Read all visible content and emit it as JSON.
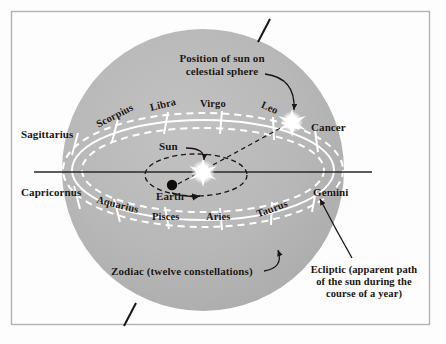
{
  "figure": {
    "border_color": "#b0b0b0",
    "background_color": "#fdfdfd",
    "sphere_color": "#b7b7b7",
    "band_line_color": "#ffffff",
    "ink_color": "#1a1512"
  },
  "annotations": {
    "sun_position": "Position of sun on\ncelestial sphere",
    "sun_position_line1": "Position of sun on",
    "sun_position_line2": "celestial sphere",
    "zodiac": "Zodiac (twelve constellations)",
    "ecliptic_line1": "Ecliptic (apparent path",
    "ecliptic_line2": "of the sun during the",
    "ecliptic_line3": "course of a year)",
    "sun": "Sun",
    "earth": "Earth"
  },
  "zodiac": {
    "band_upper": [
      {
        "name": "Scorpius"
      },
      {
        "name": "Libra"
      },
      {
        "name": "Virgo"
      },
      {
        "name": "Leo"
      }
    ],
    "band_lower": [
      {
        "name": "Aquarius"
      },
      {
        "name": "Pisces"
      },
      {
        "name": "Aries"
      },
      {
        "name": "Taurus"
      }
    ],
    "edges": [
      {
        "name": "Sagittarius",
        "side": "left-upper"
      },
      {
        "name": "Capricornus",
        "side": "left-lower"
      },
      {
        "name": "Cancer",
        "side": "right-upper"
      },
      {
        "name": "Gemini",
        "side": "right-lower"
      }
    ],
    "count": 12
  },
  "objects": {
    "sun_label": "Sun",
    "earth_label": "Earth",
    "sun_glyph": "starburst-icon",
    "earth_glyph": "dot-icon",
    "projected_sun_glyph": "starburst-icon",
    "projected_sun_constellation": "Leo"
  }
}
